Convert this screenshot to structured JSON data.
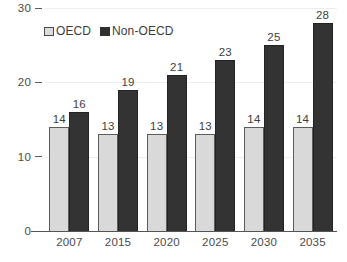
{
  "chart_data": {
    "type": "bar",
    "title": "",
    "subtitle": "",
    "xlabel": "",
    "ylabel": "",
    "categories": [
      "2007",
      "2015",
      "2020",
      "2025",
      "2030",
      "2035"
    ],
    "series": [
      {
        "name": "OECD",
        "color": "#d9d9d9",
        "values": [
          14,
          13,
          13,
          13,
          14,
          14
        ]
      },
      {
        "name": "Non-OECD",
        "color": "#333333",
        "values": [
          16,
          19,
          21,
          23,
          25,
          28
        ]
      }
    ],
    "ylim": [
      0,
      30
    ],
    "yticks": [
      "0",
      "10",
      "20",
      "30"
    ],
    "ytick_values": [
      0,
      10,
      20,
      30
    ],
    "grid": true,
    "legend_position": "top-left",
    "data_labels": true
  },
  "legend": {
    "items": [
      {
        "label": "OECD",
        "color": "#d9d9d9"
      },
      {
        "label": "Non-OECD",
        "color": "#333333"
      }
    ]
  }
}
